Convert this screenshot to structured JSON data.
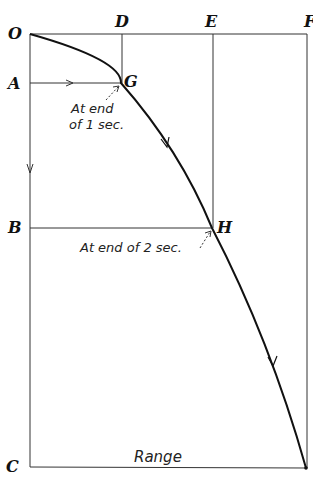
{
  "figure": {
    "type": "projectile-trajectory-diagram",
    "points": {
      "O": "O",
      "D": "D",
      "E": "E",
      "F": "F",
      "A": "A",
      "G": "G",
      "B": "B",
      "H": "H",
      "C": "C"
    },
    "annotations": {
      "g_note_line1": "At end",
      "g_note_line2": "of 1 sec.",
      "h_note": "At end of 2 sec.",
      "range": "Range"
    },
    "colors": {
      "ink": "#111111",
      "background": "#ffffff"
    }
  }
}
